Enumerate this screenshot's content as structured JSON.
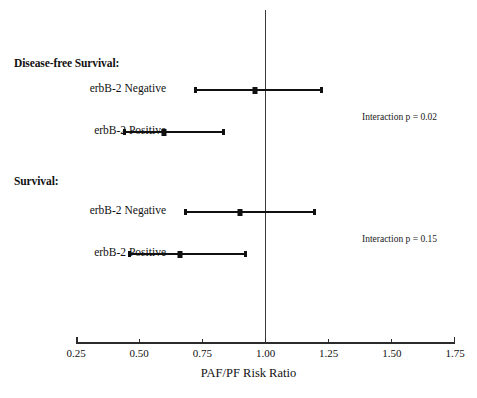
{
  "chart_data": {
    "type": "scatter",
    "subtype": "forest-plot",
    "title": "",
    "xlabel": "PAF/PF Risk Ratio",
    "ylabel": "",
    "xlim": [
      0.25,
      1.75
    ],
    "xticks": [
      "0.25",
      "0.50",
      "0.75",
      "1.00",
      "1.25",
      "1.50",
      "1.75"
    ],
    "xtick_values": [
      0.25,
      0.5,
      0.75,
      1.0,
      1.25,
      1.5,
      1.75
    ],
    "grid": false,
    "legend": "none",
    "reference_line": 1.0,
    "sections": [
      {
        "header": "Disease-free Survival:",
        "annotation": "Interaction p = 0.02",
        "rows": [
          {
            "label": "erbB-2 Negative",
            "estimate": 0.96,
            "ci_low": 0.72,
            "ci_high": 1.22
          },
          {
            "label": "erbB-2 Positive",
            "estimate": 0.6,
            "ci_low": 0.44,
            "ci_high": 0.83
          }
        ]
      },
      {
        "header": "Survival:",
        "annotation": "Interaction p = 0.15",
        "rows": [
          {
            "label": "erbB-2 Negative",
            "estimate": 0.9,
            "ci_low": 0.68,
            "ci_high": 1.19
          },
          {
            "label": "erbB-2 Positive",
            "estimate": 0.66,
            "ci_low": 0.46,
            "ci_high": 0.92
          }
        ]
      }
    ]
  },
  "layout": {
    "axis_x_start_px": 76,
    "axis_x_end_px": 455,
    "axis_y_px": 342,
    "ref_line_top_px": 10,
    "label_right_px": 166,
    "annotation_x_px": 362,
    "section_header_x_px": 14,
    "axis_title_y_px": 366,
    "tick_label_y_px": 347,
    "rows": [
      {
        "header_y_px": 57,
        "row_y_px": [
          90,
          132
        ],
        "annotation_y_px": 112
      },
      {
        "header_y_px": 175,
        "row_y_px": [
          212,
          254
        ],
        "annotation_y_px": 234
      }
    ]
  },
  "colors": {
    "ink": "#101010",
    "axis": "#2b2b2b",
    "reference_line": "#3a3a3a",
    "background": "#ffffff"
  }
}
